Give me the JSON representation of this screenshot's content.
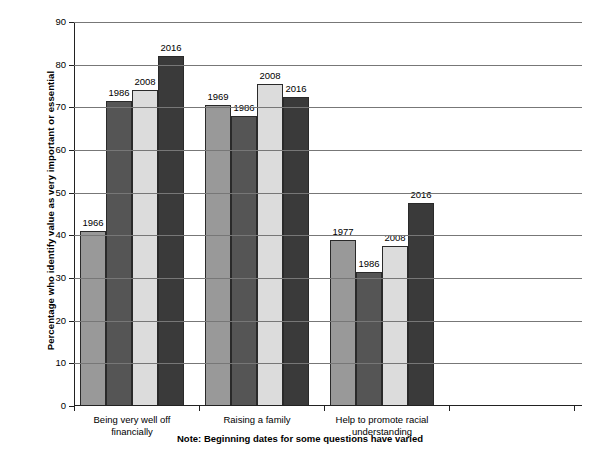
{
  "chart_data": {
    "type": "bar",
    "title": "",
    "xlabel": "",
    "ylabel": "Percentage who identify value as very important or essential",
    "ylim": [
      0,
      90
    ],
    "ytick_step": 10,
    "yticks": [
      "0",
      "10",
      "20",
      "30",
      "40",
      "50",
      "60",
      "70",
      "80",
      "90"
    ],
    "grid": true,
    "legend": "none",
    "categories": [
      "Being very well off\nfinancially",
      "Raising a family",
      "Help to promote racial\nunderstanding"
    ],
    "groups": [
      {
        "category": "Being very well off\nfinancially",
        "bars": [
          {
            "label": "1966",
            "value": 41
          },
          {
            "label": "1986",
            "value": 71.5
          },
          {
            "label": "2008",
            "value": 74
          },
          {
            "label": "2016",
            "value": 82
          }
        ]
      },
      {
        "category": "Raising a family",
        "bars": [
          {
            "label": "1969",
            "value": 70.5
          },
          {
            "label": "1986",
            "value": 68
          },
          {
            "label": "2008",
            "value": 75.5
          },
          {
            "label": "2016",
            "value": 72.5
          }
        ]
      },
      {
        "category": "Help to promote racial\nunderstanding",
        "bars": [
          {
            "label": "1977",
            "value": 39
          },
          {
            "label": "1986",
            "value": 31.5
          },
          {
            "label": "2008",
            "value": 37.5
          },
          {
            "label": "2016",
            "value": 47.5
          }
        ]
      }
    ],
    "series_colors": [
      "#999999",
      "#555555",
      "#dcdcdc",
      "#3a3a3a"
    ],
    "annotations": [
      "Note: Beginning dates for some questions have varied"
    ]
  },
  "note": "Note: Beginning dates for some questions have varied"
}
